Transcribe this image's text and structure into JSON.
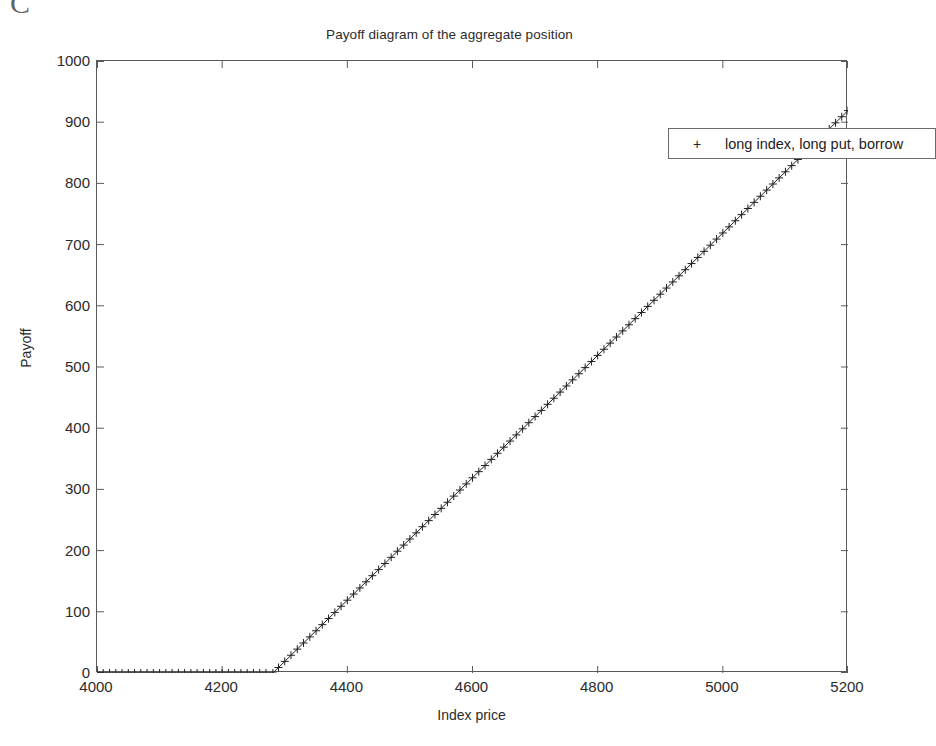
{
  "artifact": {
    "text": "C"
  },
  "chart_data": {
    "type": "line",
    "title": "Payoff diagram of the aggregate position",
    "xlabel": "Index price",
    "ylabel": "Payoff",
    "xlim": [
      4000,
      5200
    ],
    "ylim": [
      0,
      1000
    ],
    "xticks": [
      4000,
      4200,
      4400,
      4600,
      4800,
      5000,
      5200
    ],
    "yticks": [
      0,
      100,
      200,
      300,
      400,
      500,
      600,
      700,
      800,
      900,
      1000
    ],
    "grid": false,
    "marker": "+",
    "line_color": "#222222",
    "legend_position": "upper right",
    "legend": [
      "long index, long put, borrow"
    ],
    "series": [
      {
        "name": "long index, long put, borrow",
        "marker": "+",
        "kink_x": 4281,
        "slope": 1,
        "x": [
          4000,
          4010,
          4020,
          4030,
          4040,
          4050,
          4060,
          4070,
          4080,
          4090,
          4100,
          4110,
          4120,
          4130,
          4140,
          4150,
          4160,
          4170,
          4180,
          4190,
          4200,
          4210,
          4220,
          4230,
          4240,
          4250,
          4260,
          4270,
          4281,
          4290,
          4300,
          4310,
          4320,
          4330,
          4340,
          4350,
          4360,
          4370,
          4380,
          4390,
          4400,
          4410,
          4420,
          4430,
          4440,
          4450,
          4460,
          4470,
          4480,
          4490,
          4500,
          4510,
          4520,
          4530,
          4540,
          4550,
          4560,
          4570,
          4580,
          4590,
          4600,
          4610,
          4620,
          4630,
          4640,
          4650,
          4660,
          4670,
          4680,
          4690,
          4700,
          4710,
          4720,
          4730,
          4740,
          4750,
          4760,
          4770,
          4780,
          4790,
          4800,
          4810,
          4820,
          4830,
          4840,
          4850,
          4860,
          4870,
          4880,
          4890,
          4900,
          4910,
          4920,
          4930,
          4940,
          4950,
          4960,
          4970,
          4980,
          4990,
          5000,
          5010,
          5020,
          5030,
          5040,
          5050,
          5060,
          5070,
          5080,
          5090,
          5100,
          5110,
          5120,
          5130,
          5140,
          5150,
          5160,
          5170,
          5180,
          5190,
          5200
        ],
        "y": [
          0,
          0,
          0,
          0,
          0,
          0,
          0,
          0,
          0,
          0,
          0,
          0,
          0,
          0,
          0,
          0,
          0,
          0,
          0,
          0,
          0,
          0,
          0,
          0,
          0,
          0,
          0,
          0,
          0,
          9,
          19,
          29,
          39,
          49,
          59,
          69,
          79,
          89,
          99,
          109,
          119,
          129,
          139,
          149,
          159,
          169,
          179,
          189,
          199,
          209,
          219,
          229,
          239,
          249,
          259,
          269,
          279,
          289,
          299,
          309,
          319,
          329,
          339,
          349,
          359,
          369,
          379,
          389,
          399,
          409,
          419,
          429,
          439,
          449,
          459,
          469,
          479,
          489,
          499,
          509,
          519,
          529,
          539,
          549,
          559,
          569,
          579,
          589,
          599,
          609,
          619,
          629,
          639,
          649,
          659,
          669,
          679,
          689,
          699,
          709,
          719,
          729,
          739,
          749,
          759,
          769,
          779,
          789,
          799,
          809,
          819,
          829,
          839,
          849,
          859,
          869,
          879,
          889,
          899,
          909,
          919
        ]
      }
    ]
  },
  "legend_ui": {
    "marker_glyph": "+",
    "label": "long index, long put, borrow"
  }
}
